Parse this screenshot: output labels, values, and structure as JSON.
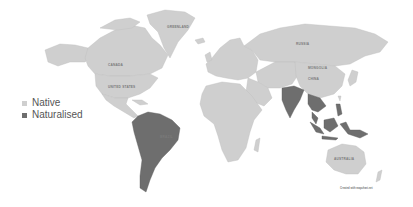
{
  "map": {
    "title": "",
    "legend": [
      {
        "label": "Native",
        "color": "#cfcfcf",
        "key": "native"
      },
      {
        "label": "Naturalised",
        "color": "#6e6e6e",
        "key": "naturalised"
      }
    ],
    "country_labels": {
      "greenland": "GREENLAND",
      "canada": "CANADA",
      "usa": "UNITED STATES",
      "russia": "RUSSIA",
      "china": "CHINA",
      "mongolia": "MONGOLIA",
      "brazil": "BRAZIL",
      "australia": "AUSTRALIA"
    },
    "regions": {
      "native": [
        "North America",
        "Greenland",
        "Europe",
        "Russia",
        "Central Asia",
        "China",
        "Middle East",
        "Africa",
        "Australia"
      ],
      "naturalised": [
        "South America",
        "India",
        "Southeast Asia",
        "Indonesia",
        "Philippines",
        "Papua New Guinea"
      ]
    },
    "credit": "Created with mapchart.net"
  }
}
